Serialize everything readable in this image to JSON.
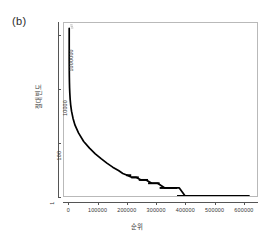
{
  "panel": {
    "label": "(b)"
  },
  "chart_data": {
    "type": "line",
    "title": "",
    "subtitle": "",
    "xlabel": "순위",
    "ylabel": "절대 빈도",
    "yscale": "log",
    "xscale": "linear",
    "xlim": [
      -18000,
      648000
    ],
    "ylim": [
      1,
      3000000
    ],
    "grid": false,
    "legend": null,
    "x_ticks": [
      0,
      100000,
      200000,
      300000,
      400000,
      500000,
      600000
    ],
    "x_tick_labels": [
      "0",
      "100000",
      "200000",
      "300000",
      "400000",
      "500000",
      "600000"
    ],
    "y_ticks": [
      1,
      100,
      10000,
      1000000
    ],
    "y_tick_labels": [
      "1",
      "100",
      "10000",
      "1000000"
    ],
    "x": [
      1,
      2,
      3,
      5,
      8,
      12,
      20,
      32,
      50,
      80,
      130,
      200,
      320,
      500,
      800,
      1300,
      2000,
      3200,
      5000,
      8000,
      13000,
      20000,
      32000,
      50000,
      70000,
      90000,
      110000,
      130000,
      150000,
      170000,
      185000,
      200000,
      215000,
      230000,
      248000,
      265000,
      285000,
      305000,
      330000,
      345000,
      360000,
      380000,
      400000,
      450000,
      500000,
      560000,
      620000
    ],
    "y": [
      1900000,
      1400000,
      1100000,
      820000,
      600000,
      450000,
      330000,
      240000,
      175000,
      125000,
      88000,
      62000,
      42000,
      28000,
      18000,
      11000,
      7200,
      4300,
      2600,
      1500,
      820,
      450,
      230,
      110,
      62,
      38,
      25,
      17,
      12,
      9,
      7,
      6,
      5,
      5,
      4,
      4,
      3,
      3,
      2,
      2,
      2,
      2,
      1,
      1,
      1,
      1,
      1
    ],
    "series": [
      {
        "name": "frequency",
        "color": "#000000",
        "x": [
          1,
          2,
          3,
          5,
          8,
          12,
          20,
          32,
          50,
          80,
          130,
          200,
          320,
          500,
          800,
          1300,
          2000,
          3200,
          5000,
          8000,
          13000,
          20000,
          32000,
          50000,
          70000,
          90000,
          110000,
          130000,
          150000,
          170000,
          185000,
          200000,
          215000,
          230000,
          248000,
          265000,
          285000,
          305000,
          330000,
          345000,
          360000,
          380000,
          400000,
          450000,
          500000,
          560000,
          620000
        ],
        "y": [
          1900000,
          1400000,
          1100000,
          820000,
          600000,
          450000,
          330000,
          240000,
          175000,
          125000,
          88000,
          62000,
          42000,
          28000,
          18000,
          11000,
          7200,
          4300,
          2600,
          1500,
          820,
          450,
          230,
          110,
          62,
          38,
          25,
          17,
          12,
          9,
          7,
          6,
          5,
          5,
          4,
          4,
          3,
          3,
          2,
          2,
          2,
          2,
          1,
          1,
          1,
          1,
          1
        ]
      }
    ],
    "steps": [
      {
        "value": 6,
        "x_start": 196000,
        "x_end": 214000
      },
      {
        "value": 5,
        "x_start": 214000,
        "x_end": 240000
      },
      {
        "value": 4,
        "x_start": 240000,
        "x_end": 272000
      },
      {
        "value": 3,
        "x_start": 272000,
        "x_end": 312000
      },
      {
        "value": 2,
        "x_start": 312000,
        "x_end": 372000
      },
      {
        "value": 1,
        "x_start": 372000,
        "x_end": 622000
      }
    ]
  }
}
